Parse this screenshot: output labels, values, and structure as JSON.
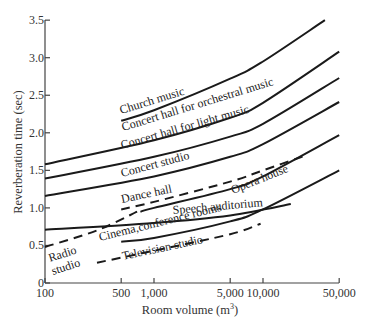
{
  "chart_data": {
    "type": "line",
    "title": "",
    "xlabel": "Room volume (m³)",
    "ylabel": "Reverberation time (sec)",
    "x_scale": "log",
    "xlim": [
      100,
      50000
    ],
    "ylim": [
      0,
      3.5
    ],
    "grid": false,
    "legend": "inline labels",
    "x_ticks": [
      {
        "value": 100,
        "label": "100"
      },
      {
        "value": 500,
        "label": "500"
      },
      {
        "value": 1000,
        "label": "1,000"
      },
      {
        "value": 5000,
        "label": "5,000"
      },
      {
        "value": 10000,
        "label": "10,000"
      },
      {
        "value": 50000,
        "label": "50,000"
      }
    ],
    "y_ticks": [
      {
        "value": 0,
        "label": "0"
      },
      {
        "value": 0.5,
        "label": "0.5"
      },
      {
        "value": 1.0,
        "label": "1.0"
      },
      {
        "value": 1.5,
        "label": "1.5"
      },
      {
        "value": 2.0,
        "label": "2.0"
      },
      {
        "value": 2.5,
        "label": "2.5"
      },
      {
        "value": 3.0,
        "label": "3.0"
      },
      {
        "value": 3.5,
        "label": "3.5"
      }
    ],
    "series": [
      {
        "name": "Church music",
        "style": "solid",
        "x": [
          500,
          1000,
          5000,
          10000,
          37000
        ],
        "y": [
          2.16,
          2.3,
          2.72,
          2.95,
          3.5
        ]
      },
      {
        "name": "Concert hall for orchestral music",
        "style": "solid",
        "x": [
          100,
          1000,
          5000,
          10000,
          50000
        ],
        "y": [
          1.58,
          1.9,
          2.2,
          2.4,
          3.08
        ]
      },
      {
        "name": "Concert hall for light music",
        "style": "solid",
        "x": [
          100,
          1000,
          5000,
          10000,
          50000
        ],
        "y": [
          1.39,
          1.68,
          1.95,
          2.12,
          2.73
        ]
      },
      {
        "name": "Concert studio",
        "style": "solid",
        "x": [
          100,
          1000,
          5000,
          10000,
          50000
        ],
        "y": [
          1.16,
          1.42,
          1.68,
          1.85,
          2.41
        ]
      },
      {
        "name": "Opera house",
        "style": "solid",
        "x": [
          750,
          1000,
          5000,
          10000,
          50000
        ],
        "y": [
          0.95,
          1.0,
          1.25,
          1.42,
          1.97
        ]
      },
      {
        "name": "Dance hall",
        "style": "dashed",
        "x": [
          500,
          1000,
          5000,
          10000,
          25000
        ],
        "y": [
          0.98,
          1.08,
          1.35,
          1.5,
          1.7
        ]
      },
      {
        "name": "Radio studio",
        "style": "dashed",
        "x": [
          100,
          300,
          700
        ],
        "y": [
          0.48,
          0.7,
          0.95
        ]
      },
      {
        "name": "Speech auditorium",
        "style": "solid",
        "x": [
          100,
          1000,
          5000,
          18000
        ],
        "y": [
          0.71,
          0.8,
          0.9,
          1.05
        ]
      },
      {
        "name": "Cinema, conference rooms",
        "style": "solid",
        "x": [
          500,
          1000,
          5000,
          10000,
          50000
        ],
        "y": [
          0.55,
          0.6,
          0.82,
          0.98,
          1.5
        ]
      },
      {
        "name": "Television studio",
        "style": "dashed",
        "x": [
          300,
          1000,
          5000,
          9500
        ],
        "y": [
          0.27,
          0.43,
          0.65,
          0.79
        ]
      }
    ]
  },
  "labels": {
    "church": "Church music",
    "orchestral": "Concert hall for orchestral music",
    "light": "Concert hall for light music",
    "studio": "Concert studio",
    "dance": "Dance hall",
    "opera": "Opera house",
    "speech": "Speech auditorium",
    "cinema": "Cinema,conference rooms",
    "radio1": "Radio",
    "radio2": "studio",
    "tv": "Television studio"
  },
  "axes": {
    "xlabel": "Room volume (m",
    "xlabel_sup": "3",
    "xlabel_end": ")",
    "ylabel": "Reverberation time (sec)"
  }
}
